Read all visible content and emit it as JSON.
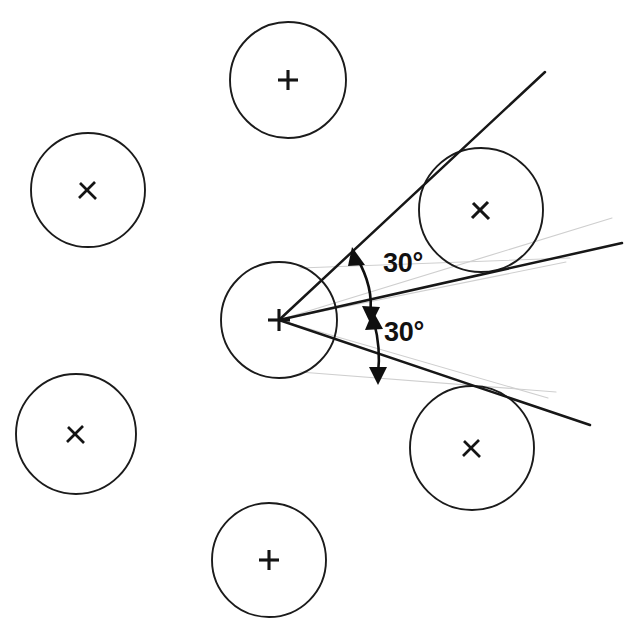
{
  "figure": {
    "type": "geometric-diagram",
    "background_color": "#ffffff",
    "width": 626,
    "height": 636,
    "stroke_color": "#1b1b1b",
    "construction_color": "#cfcfcf"
  },
  "annotations": {
    "upper_angle_label": "30°",
    "lower_angle_label": "30°"
  },
  "chart_data": {
    "type": "scatter",
    "title": "",
    "xlabel": "",
    "ylabel": "",
    "grid": false,
    "legend": "none",
    "xlim": [
      0,
      626
    ],
    "ylim": [
      0,
      636
    ],
    "circles": [
      {
        "id": "circle-upper-left",
        "cx": 88,
        "cy": 190,
        "r": 57,
        "marker": "x"
      },
      {
        "id": "circle-top",
        "cx": 288,
        "cy": 80,
        "r": 58,
        "marker": "plus"
      },
      {
        "id": "circle-center",
        "cx": 279,
        "cy": 320,
        "r": 58,
        "marker": "plus"
      },
      {
        "id": "circle-upper-right",
        "cx": 481,
        "cy": 210,
        "r": 62,
        "marker": "x"
      },
      {
        "id": "circle-lower-left",
        "cx": 76,
        "cy": 434,
        "r": 60,
        "marker": "x"
      },
      {
        "id": "circle-lower-right",
        "cx": 472,
        "cy": 448,
        "r": 62,
        "marker": "x"
      },
      {
        "id": "circle-bottom",
        "cx": 269,
        "cy": 560,
        "r": 57,
        "marker": "plus"
      }
    ],
    "vertex": {
      "x": 279,
      "y": 320
    },
    "rays": [
      {
        "id": "ray-upper",
        "x1": 279,
        "y1": 320,
        "x2": 545,
        "y2": 72,
        "angle_deg": 43
      },
      {
        "id": "ray-middle",
        "x1": 279,
        "y1": 320,
        "x2": 622,
        "y2": 243,
        "angle_deg": 13
      },
      {
        "id": "ray-lower",
        "x1": 279,
        "y1": 320,
        "x2": 590,
        "y2": 425,
        "angle_deg": -17
      }
    ],
    "angles": [
      {
        "id": "angle-upper",
        "between": [
          "ray-upper",
          "ray-middle"
        ],
        "value": 30,
        "unit": "deg",
        "label": "30°"
      },
      {
        "id": "angle-lower",
        "between": [
          "ray-middle",
          "ray-lower"
        ],
        "value": 30,
        "unit": "deg",
        "label": "30°"
      }
    ],
    "construction_lines": [
      {
        "id": "construction-upper",
        "x1": 279,
        "y1": 320,
        "x2": 560,
        "y2": 262
      },
      {
        "id": "construction-mid",
        "x1": 279,
        "y1": 320,
        "x2": 604,
        "y2": 220
      },
      {
        "id": "construction-lower",
        "x1": 279,
        "y1": 320,
        "x2": 540,
        "y2": 395
      }
    ]
  }
}
